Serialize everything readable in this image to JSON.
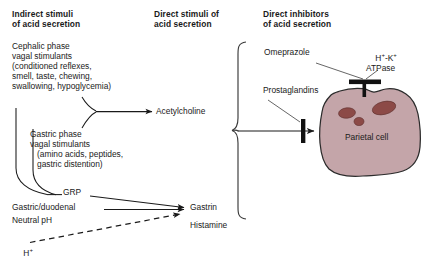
{
  "figure": {
    "title_absent": true,
    "background_color": "#ffffff",
    "cell_fill": "#c4a5a9",
    "cell_stroke": "#2b2b2b",
    "organelle_fill": "#8c4a47",
    "line_color": "#1a1a1a"
  },
  "headings": {
    "indirect": "Indirect stimuli\nof acid secretion",
    "direct": "Direct stimuli of\nacid secretion",
    "inhibitors": "Direct inhibitors\nof acid secretion"
  },
  "indirect_column": {
    "cephalic": "Cephalic phase\nvagal stimulants\n(conditioned reflexes,\nsmell, taste, chewing,\nswallowing, hypoglycemia)",
    "gastric": "Gastric phase\nvagal stimulants\n   (amino acids, peptides,\n   gastric distention)",
    "grp": "GRP",
    "gastric_duodenal": "Gastric/duodenal",
    "neutral_ph": "Neutral pH",
    "hydrogen_ion": "H",
    "hydrogen_ion_charge": "+"
  },
  "direct_column": {
    "acetylcholine": "Acetylcholine",
    "gastrin": "Gastrin",
    "histamine": "Histamine"
  },
  "inhibitor_column": {
    "omeprazole": "Omeprazole",
    "prostaglandins": "Prostaglandins"
  },
  "cell": {
    "label": "Parietal cell",
    "pump_label_line1": "H",
    "pump_label_sup1": "+",
    "pump_label_mid": "-K",
    "pump_label_sup2": "+",
    "pump_label_line2": "ATPase"
  }
}
